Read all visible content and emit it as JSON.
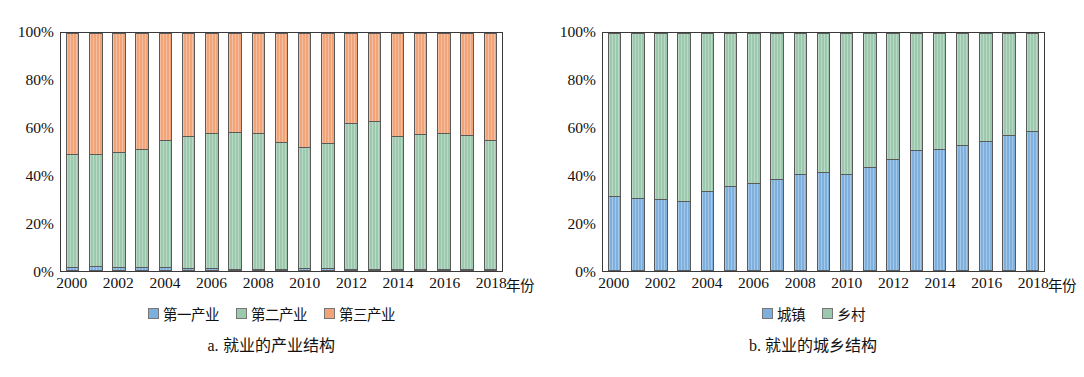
{
  "figure": {
    "panels": [
      {
        "id": "panel-a",
        "caption": "a. 就业的产业结构",
        "x_unit_label": "年份",
        "y_ticks": [
          "100%",
          "80%",
          "60%",
          "40%",
          "20%",
          "0%"
        ],
        "x_ticks": [
          "2000",
          "2002",
          "2004",
          "2006",
          "2008",
          "2010",
          "2012",
          "2014",
          "2016",
          "2018"
        ],
        "legend": [
          {
            "label": "第一产业",
            "color": "#7EB0DE"
          },
          {
            "label": "第二产业",
            "color": "#9CC8AD"
          },
          {
            "label": "第三产业",
            "color": "#F2A479"
          }
        ]
      },
      {
        "id": "panel-b",
        "caption": "b. 就业的城乡结构",
        "x_unit_label": "年份",
        "y_ticks": [
          "100%",
          "80%",
          "60%",
          "40%",
          "20%",
          "0%"
        ],
        "x_ticks": [
          "2000",
          "2002",
          "2004",
          "2006",
          "2008",
          "2010",
          "2012",
          "2014",
          "2016",
          "2018"
        ],
        "legend": [
          {
            "label": "城镇",
            "color": "#7EB0DE"
          },
          {
            "label": "乡村",
            "color": "#9CC8AD"
          }
        ]
      }
    ]
  },
  "chart_data": [
    {
      "id": "panel-a",
      "type": "bar",
      "subtype": "stacked-100-percent",
      "title": "a. 就业的产业结构",
      "xlabel": "年份",
      "ylabel": "",
      "ylim": [
        0,
        100
      ],
      "yticks": [
        0,
        20,
        40,
        60,
        80,
        100
      ],
      "ytick_labels": [
        "0%",
        "20%",
        "40%",
        "60%",
        "80%",
        "100%"
      ],
      "grid": false,
      "legend_position": "bottom-center",
      "categories": [
        "2000",
        "2001",
        "2002",
        "2003",
        "2004",
        "2005",
        "2006",
        "2007",
        "2008",
        "2009",
        "2010",
        "2011",
        "2012",
        "2013",
        "2014",
        "2015",
        "2016",
        "2017",
        "2018"
      ],
      "series": [
        {
          "name": "第一产业",
          "color": "#7EB0DE",
          "values": [
            1.8,
            1.9,
            1.8,
            1.6,
            1.6,
            1.3,
            1.2,
            1.0,
            0.9,
            0.9,
            1.1,
            1.2,
            0.8,
            0.7,
            0.6,
            0.6,
            0.6,
            0.5,
            0.5
          ]
        },
        {
          "name": "第二产业",
          "color": "#9CC8AD",
          "values": [
            47.2,
            47.1,
            48.4,
            49.8,
            53.6,
            55.4,
            56.6,
            57.5,
            56.9,
            53.5,
            50.9,
            52.5,
            61.5,
            62.1,
            56.1,
            56.7,
            57.2,
            56.4,
            54.5
          ]
        },
        {
          "name": "第三产业",
          "color": "#F2A479",
          "values": [
            51.0,
            51.0,
            49.8,
            48.6,
            44.8,
            43.3,
            42.2,
            41.5,
            42.2,
            45.6,
            48.0,
            46.3,
            37.7,
            37.2,
            43.3,
            42.7,
            42.2,
            43.1,
            45.0
          ]
        }
      ]
    },
    {
      "id": "panel-b",
      "type": "bar",
      "subtype": "stacked-100-percent",
      "title": "b. 就业的城乡结构",
      "xlabel": "年份",
      "ylabel": "",
      "ylim": [
        0,
        100
      ],
      "yticks": [
        0,
        20,
        40,
        60,
        80,
        100
      ],
      "ytick_labels": [
        "0%",
        "20%",
        "40%",
        "60%",
        "80%",
        "100%"
      ],
      "grid": false,
      "legend_position": "bottom-center",
      "categories": [
        "2000",
        "2001",
        "2002",
        "2003",
        "2004",
        "2005",
        "2006",
        "2007",
        "2008",
        "2009",
        "2010",
        "2011",
        "2012",
        "2013",
        "2014",
        "2015",
        "2016",
        "2017",
        "2018"
      ],
      "series": [
        {
          "name": "城镇",
          "color": "#7EB0DE",
          "values": [
            31.5,
            30.5,
            30.2,
            29.6,
            33.8,
            35.6,
            37.0,
            38.8,
            40.7,
            41.6,
            40.8,
            43.8,
            47.0,
            50.9,
            51.2,
            53.0,
            54.8,
            57.2,
            59.0
          ]
        },
        {
          "name": "乡村",
          "color": "#9CC8AD",
          "values": [
            68.5,
            69.5,
            69.8,
            70.4,
            66.2,
            64.4,
            63.0,
            61.2,
            59.3,
            58.4,
            59.2,
            56.2,
            53.0,
            49.1,
            48.8,
            47.0,
            45.2,
            42.8,
            41.0
          ]
        }
      ]
    }
  ]
}
